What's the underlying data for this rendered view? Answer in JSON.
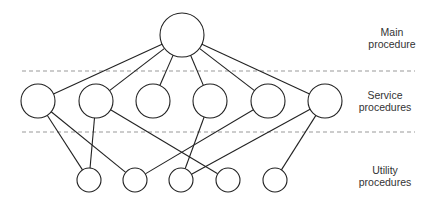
{
  "diagram": {
    "levels": [
      {
        "id": "main",
        "label_line1": "Main",
        "label_line2": "procedure"
      },
      {
        "id": "service",
        "label_line1": "Service",
        "label_line2": "procedures"
      },
      {
        "id": "utility",
        "label_line1": "Utility",
        "label_line2": "procedures"
      }
    ],
    "nodes": {
      "main": [
        {
          "id": "M",
          "cx": 182,
          "cy": 35,
          "r": 22
        }
      ],
      "service": [
        {
          "id": "S1",
          "cx": 38,
          "cy": 101,
          "r": 17
        },
        {
          "id": "S2",
          "cx": 96,
          "cy": 101,
          "r": 17
        },
        {
          "id": "S3",
          "cx": 153,
          "cy": 101,
          "r": 17
        },
        {
          "id": "S4",
          "cx": 210,
          "cy": 101,
          "r": 17
        },
        {
          "id": "S5",
          "cx": 268,
          "cy": 101,
          "r": 17
        },
        {
          "id": "S6",
          "cx": 325,
          "cy": 101,
          "r": 17
        }
      ],
      "utility": [
        {
          "id": "U1",
          "cx": 89,
          "cy": 180,
          "r": 12
        },
        {
          "id": "U2",
          "cx": 135,
          "cy": 180,
          "r": 12
        },
        {
          "id": "U3",
          "cx": 181,
          "cy": 180,
          "r": 12
        },
        {
          "id": "U4",
          "cx": 228,
          "cy": 180,
          "r": 12
        },
        {
          "id": "U5",
          "cx": 275,
          "cy": 180,
          "r": 12
        }
      ]
    },
    "edges": [
      [
        "M",
        "S1"
      ],
      [
        "M",
        "S2"
      ],
      [
        "M",
        "S3"
      ],
      [
        "M",
        "S4"
      ],
      [
        "M",
        "S5"
      ],
      [
        "M",
        "S6"
      ],
      [
        "S1",
        "U1"
      ],
      [
        "S1",
        "U2"
      ],
      [
        "S2",
        "U1"
      ],
      [
        "S2",
        "U4"
      ],
      [
        "S4",
        "U3"
      ],
      [
        "S5",
        "U2"
      ],
      [
        "S6",
        "U3"
      ],
      [
        "S6",
        "U5"
      ]
    ],
    "separators": [
      {
        "y": 71,
        "x1": 22,
        "x2": 415
      },
      {
        "y": 132,
        "x1": 22,
        "x2": 415
      }
    ],
    "colors": {
      "stroke": "#222222",
      "dash": "#999999",
      "text": "#333333"
    }
  }
}
